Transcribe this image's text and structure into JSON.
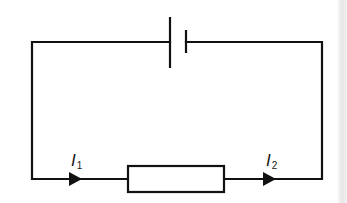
{
  "diagram": {
    "type": "circuit",
    "components": [
      {
        "kind": "cell",
        "name": "battery"
      },
      {
        "kind": "resistor",
        "name": "resistor"
      }
    ],
    "labels": {
      "current_1": {
        "symbol": "I",
        "subscript": "1"
      },
      "current_2": {
        "symbol": "I",
        "subscript": "2"
      }
    },
    "colors": {
      "wire": "#111111",
      "background": "#ffffff",
      "edge_strip": "#e8e8e8"
    }
  }
}
